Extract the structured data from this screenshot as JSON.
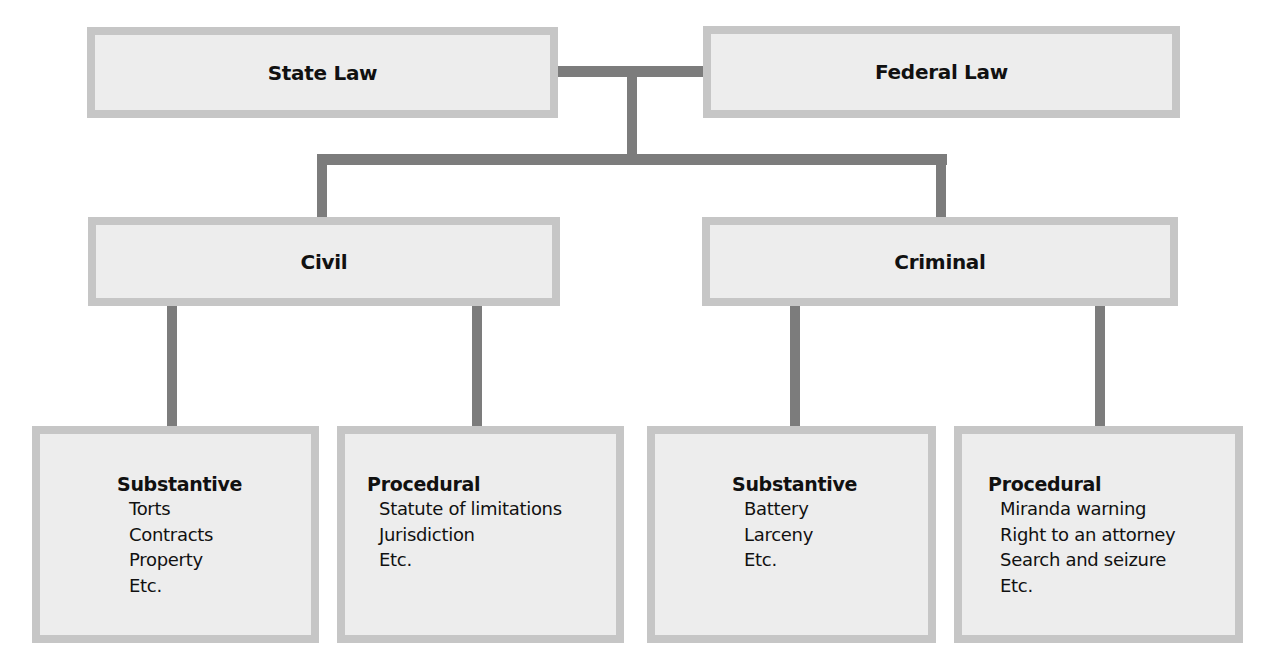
{
  "diagram": {
    "top": {
      "state_law": "State Law",
      "federal_law": "Federal Law"
    },
    "middle": {
      "civil": "Civil",
      "criminal": "Criminal"
    },
    "leaves": [
      {
        "heading": "Substantive",
        "items": [
          "Torts",
          "Contracts",
          "Property",
          "Etc."
        ]
      },
      {
        "heading": "Procedural",
        "items": [
          "Statute of limitations",
          "Jurisdiction",
          "Etc."
        ]
      },
      {
        "heading": "Substantive",
        "items": [
          "Battery",
          "Larceny",
          "Etc."
        ]
      },
      {
        "heading": "Procedural",
        "items": [
          "Miranda warning",
          "Right to an attorney",
          "Search and seizure",
          "Etc."
        ]
      }
    ],
    "colors": {
      "box_border": "#c6c6c6",
      "box_fill": "#ededed",
      "connector": "#7c7c7c"
    }
  }
}
